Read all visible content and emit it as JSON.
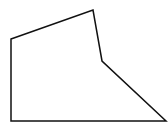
{
  "diagram": {
    "type": "polygon",
    "shape": "pentagon",
    "stroke_color": "#111111",
    "fill_color": "none",
    "stroke_width": 1.5,
    "vertices": [
      {
        "x": 11,
        "y": 39
      },
      {
        "x": 93,
        "y": 10
      },
      {
        "x": 102,
        "y": 61
      },
      {
        "x": 166,
        "y": 121
      },
      {
        "x": 11,
        "y": 121
      }
    ]
  }
}
